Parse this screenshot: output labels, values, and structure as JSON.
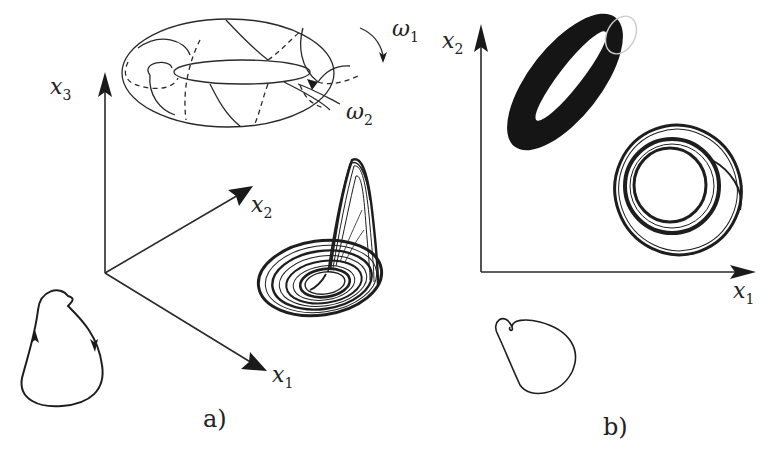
{
  "figure": {
    "panels": [
      {
        "id": "a",
        "caption": "a)",
        "axes": {
          "x1": {
            "base": "x",
            "sub": "1"
          },
          "x2": {
            "base": "x",
            "sub": "2"
          },
          "x3": {
            "base": "x",
            "sub": "3"
          }
        },
        "torus": {
          "frequency_labels": [
            {
              "base": "ω",
              "sub": "1"
            },
            {
              "base": "ω",
              "sub": "2"
            }
          ]
        },
        "elements": [
          "torus-with-quasiperiodic-orbit",
          "rossler-chaotic-attractor",
          "limit-cycle-with-direction-arrows"
        ]
      },
      {
        "id": "b",
        "caption": "b)",
        "axes": {
          "x1": {
            "base": "x",
            "sub": "1"
          },
          "x2": {
            "base": "x",
            "sub": "2"
          }
        },
        "elements": [
          "filled-torus-projection",
          "chaotic-attractor-projection",
          "limit-cycle-projection"
        ]
      }
    ]
  }
}
